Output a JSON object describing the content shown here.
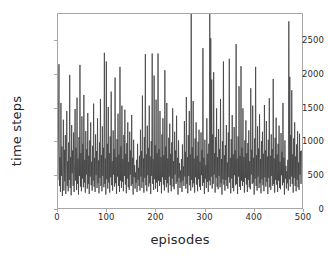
{
  "chart_data": {
    "type": "line",
    "title": "",
    "xlabel": "episodes",
    "ylabel": "time steps",
    "xlim": [
      0,
      500
    ],
    "ylim": [
      0,
      2900
    ],
    "xticks": [
      0,
      100,
      200,
      300,
      400,
      500
    ],
    "yticks": [
      0,
      500,
      1000,
      1500,
      2000,
      2500
    ],
    "grid": false,
    "legend": null,
    "series": [
      {
        "name": "time steps per episode",
        "color": "#3f3f3f",
        "linewidth": 0.8,
        "x_start": 0,
        "x_step": 1,
        "values": [
          420,
          1180,
          2150,
          330,
          760,
          240,
          1570,
          480,
          920,
          180,
          640,
          1320,
          260,
          870,
          400,
          1090,
          210,
          560,
          1450,
          330,
          700,
          250,
          980,
          420,
          1990,
          300,
          760,
          190,
          1240,
          520,
          860,
          330,
          1130,
          240,
          680,
          1480,
          410,
          900,
          270,
          1650,
          360,
          740,
          200,
          1060,
          480,
          2140,
          320,
          820,
          250,
          1370,
          440,
          960,
          310,
          1690,
          380,
          720,
          230,
          1150,
          500,
          880,
          290,
          1420,
          360,
          780,
          210,
          1010,
          470,
          1280,
          340,
          690,
          260,
          930,
          410,
          1560,
          320,
          750,
          240,
          1100,
          490,
          850,
          300,
          1340,
          370,
          710,
          220,
          980,
          450,
          1630,
          330,
          790,
          250,
          1220,
          480,
          900,
          310,
          2320,
          360,
          740,
          200,
          2190,
          430,
          960,
          290,
          1510,
          380,
          820,
          230,
          1070,
          460,
          1740,
          340,
          700,
          260,
          1160,
          500,
          880,
          320,
          1950,
          370,
          760,
          210,
          1030,
          470,
          1410,
          330,
          800,
          240,
          2110,
          410,
          920,
          300,
          1530,
          390,
          730,
          250,
          1090,
          480,
          1470,
          350,
          810,
          220,
          970,
          440,
          1280,
          310,
          690,
          270,
          1140,
          500,
          860,
          330,
          1390,
          360,
          750,
          200,
          1020,
          460,
          640,
          290,
          530,
          380,
          720,
          240,
          960,
          420,
          600,
          330,
          780,
          260,
          1170,
          470,
          850,
          300,
          1680,
          390,
          740,
          230,
          1060,
          450,
          2300,
          340,
          800,
          250,
          1230,
          490,
          900,
          320,
          1530,
          370,
          770,
          210,
          1000,
          480,
          2310,
          360,
          730,
          270,
          1980,
          430,
          940,
          290,
          1620,
          380,
          820,
          240,
          2310,
          410,
          880,
          330,
          1450,
          390,
          760,
          220,
          1100,
          460,
          1340,
          350,
          790,
          260,
          2060,
          420,
          920,
          310,
          1570,
          370,
          740,
          230,
          1050,
          470,
          1260,
          340,
          810,
          250,
          980,
          440,
          1490,
          320,
          700,
          280,
          1140,
          500,
          860,
          360,
          1380,
          390,
          750,
          200,
          1010,
          450,
          670,
          300,
          560,
          380,
          730,
          240,
          950,
          410,
          620,
          330,
          1300,
          470,
          840,
          290,
          1660,
          360,
          760,
          220,
          1090,
          480,
          1450,
          340,
          800,
          260,
          2900,
          420,
          910,
          310,
          1600,
          370,
          740,
          230,
          1040,
          460,
          1280,
          350,
          780,
          250,
          990,
          430,
          1170,
          320,
          690,
          270,
          1130,
          490,
          870,
          330,
          2390,
          380,
          750,
          210,
          1020,
          440,
          640,
          300,
          1340,
          390,
          810,
          240,
          960,
          410,
          2900,
          340,
          2540,
          470,
          1920,
          290,
          1100,
          360,
          2030,
          500,
          820,
          230,
          1060,
          450,
          1490,
          320,
          760,
          280,
          1180,
          480,
          880,
          310,
          1630,
          370,
          730,
          200,
          1000,
          430,
          2190,
          350,
          790,
          260,
          940,
          420,
          1240,
          330,
          680,
          290,
          1130,
          460,
          2230,
          380,
          750,
          220,
          1030,
          440,
          1390,
          300,
          800,
          250,
          1210,
          490,
          860,
          340,
          2450,
          360,
          740,
          210,
          1070,
          470,
          1820,
          320,
          780,
          270,
          2120,
          410,
          900,
          330,
          1490,
          390,
          760,
          230,
          1010,
          450,
          1310,
          350,
          820,
          240,
          970,
          420,
          1160,
          310,
          700,
          280,
          1790,
          500,
          870,
          360,
          1530,
          380,
          750,
          200,
          1040,
          440,
          2110,
          330,
          790,
          260,
          1220,
          470,
          890,
          300,
          1400,
          370,
          730,
          220,
          1000,
          430,
          1140,
          340,
          810,
          250,
          1540,
          460,
          860,
          320,
          1300,
          390,
          770,
          210,
          1020,
          450,
          1640,
          310,
          780,
          270,
          1100,
          480,
          880,
          330,
          1930,
          360,
          740,
          230,
          1050,
          420,
          1350,
          350,
          800,
          240,
          960,
          410,
          1230,
          300,
          690,
          280,
          1120,
          490,
          840,
          340,
          1570,
          380,
          750,
          200,
          1010,
          440,
          630,
          290,
          550,
          370,
          720,
          260,
          2790,
          430,
          1960,
          320,
          1090,
          470,
          1760,
          360,
          800,
          230,
          1040,
          450,
          1280,
          330,
          770,
          250,
          950,
          420,
          1150,
          310,
          680,
          270,
          1110,
          500,
          850,
          360,
          860
        ]
      }
    ],
    "annotations": [
      {
        "note": "three spikes clip the top of the axes frame",
        "x": [
          278,
          320,
          490
        ]
      }
    ]
  },
  "figure": {
    "background_color": "#ffffff",
    "frame_color": "#a7a7a7",
    "tick_text_color": "#2b2b2b",
    "label_text_color": "#262626"
  }
}
